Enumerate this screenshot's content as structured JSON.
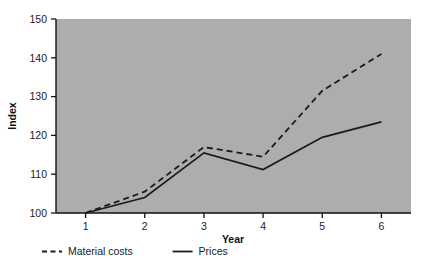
{
  "chart_data": {
    "type": "line",
    "title": "",
    "xlabel": "Year",
    "ylabel": "Index",
    "x": [
      1,
      2,
      3,
      4,
      5,
      6
    ],
    "categories": [
      "1",
      "2",
      "3",
      "4",
      "5",
      "6"
    ],
    "xtick_labels": [
      "1",
      "2",
      "3",
      "4",
      "5",
      "6"
    ],
    "ytick_labels": [
      "100",
      "110",
      "120",
      "130",
      "140",
      "150"
    ],
    "yticks": [
      100,
      110,
      120,
      130,
      140,
      150
    ],
    "ylim": [
      100,
      150
    ],
    "xlim": [
      0.5,
      6.5
    ],
    "grid": false,
    "legend_position": "below-left",
    "plot_background_color": "#adadad",
    "page_background_color": "#ffffff",
    "line_color": "#1a1a1a",
    "series": [
      {
        "name": "Material costs",
        "style": "dashed",
        "values": [
          100,
          105.5,
          117,
          114.5,
          131.5,
          141
        ]
      },
      {
        "name": "Prices",
        "style": "solid",
        "values": [
          100,
          104,
          115.5,
          111.2,
          119.5,
          123.5
        ]
      }
    ],
    "legend": [
      {
        "label": "Material costs",
        "style": "dashed"
      },
      {
        "label": "Prices",
        "style": "solid"
      }
    ]
  }
}
